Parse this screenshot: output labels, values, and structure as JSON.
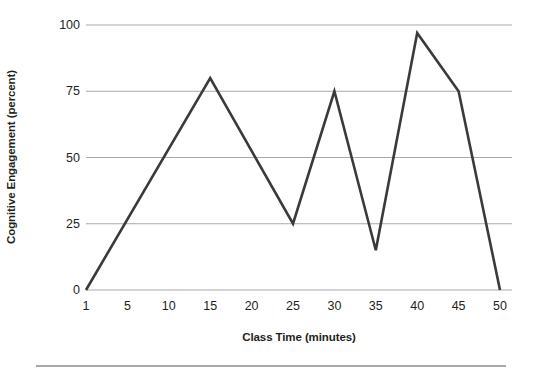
{
  "figure": {
    "name": "cognitive-engagement-line-chart",
    "background_color": "#ffffff",
    "bottom_rule_color": "#a8a8a8"
  },
  "chart_data": {
    "type": "line",
    "title": "",
    "subtitle": "",
    "xlabel": "Class Time (minutes)",
    "ylabel": "Cognitive Engagement (percent)",
    "xlim": [
      1,
      50
    ],
    "ylim": [
      0,
      100
    ],
    "grid": true,
    "grid_axis": "y",
    "legend": false,
    "legend_position": "none",
    "x_tick_labels": [
      "1",
      "5",
      "10",
      "15",
      "20",
      "25",
      "30",
      "35",
      "40",
      "45",
      "50"
    ],
    "x_ticks": [
      1,
      5,
      10,
      15,
      20,
      25,
      30,
      35,
      40,
      45,
      50
    ],
    "x_scale": "categorical-even-spacing",
    "y_tick_labels": [
      "0",
      "25",
      "50",
      "75",
      "100"
    ],
    "y_ticks": [
      0,
      25,
      50,
      75,
      100
    ],
    "series": [
      {
        "name": "Cognitive Engagement",
        "color": "#3a3a3a",
        "line_width": 2.6,
        "markers": false,
        "x": [
          1,
          15,
          25,
          30,
          35,
          40,
          45,
          50
        ],
        "values": [
          0,
          80,
          25,
          75,
          15,
          97,
          75,
          0
        ]
      }
    ],
    "annotations": [],
    "colors": {
      "line": "#3a3a3a",
      "gridline": "#a9a9a9",
      "axis": "#a9a9a9",
      "text": "#231f20"
    }
  }
}
